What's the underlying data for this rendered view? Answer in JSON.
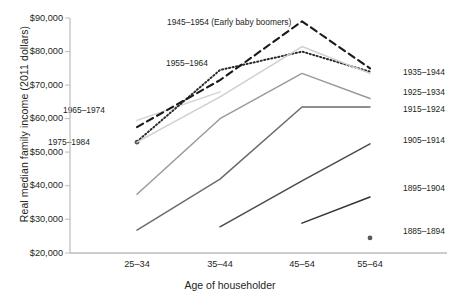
{
  "chart_data": {
    "type": "line",
    "title": "",
    "xlabel": "Age of householder",
    "ylabel": "Real median family income (2011 dollars)",
    "categories": [
      "25–34",
      "35–44",
      "45–54",
      "55–64"
    ],
    "ylim": [
      20000,
      90000
    ],
    "ytick_labels": [
      "$20,000",
      "$30,000",
      "$40,000",
      "$50,000",
      "$60,000",
      "$70,000",
      "$80,000",
      "$90,000"
    ],
    "ytick_values": [
      20000,
      30000,
      40000,
      50000,
      60000,
      70000,
      80000,
      90000
    ],
    "grid": false,
    "legend": "inline-labels",
    "series": [
      {
        "name": "1975–1984",
        "label": "1975–1984",
        "style": "marker",
        "color": "#5a5a5a",
        "x": [
          "25–34"
        ],
        "values": [
          53000
        ]
      },
      {
        "name": "1965–1974",
        "label": "1965–1974",
        "style": "solid",
        "color": "#d2d2d2",
        "x": [
          "25–34",
          "35–44"
        ],
        "values": [
          59500,
          68000
        ]
      },
      {
        "name": "1955–1964",
        "label": "1955–1964",
        "style": "dotted",
        "color": "#2b2b2b",
        "x": [
          "25–34",
          "35–44",
          "45–54",
          "55–64"
        ],
        "values": [
          53200,
          74500,
          80000,
          74000
        ]
      },
      {
        "name": "1945–1954 (Early baby boomers)",
        "label": "1945–1954 (Early baby boomers)",
        "style": "dashed",
        "color": "#1a1a1a",
        "x": [
          "25–34",
          "35–44",
          "45–54",
          "55–64"
        ],
        "values": [
          57500,
          71500,
          89000,
          75000
        ]
      },
      {
        "name": "1935–1944",
        "label": "1935–1944",
        "style": "solid",
        "color": "#cfcfcf",
        "x": [
          "25–34",
          "35–44",
          "45–54",
          "55–64"
        ],
        "values": [
          53000,
          66500,
          81500,
          73500
        ]
      },
      {
        "name": "1925–1934",
        "label": "1925–1934",
        "style": "solid",
        "color": "#9a9a9a",
        "x": [
          "25–34",
          "35–44",
          "45–54",
          "55–64"
        ],
        "values": [
          37500,
          60000,
          73500,
          66000
        ]
      },
      {
        "name": "1915–1924",
        "label": "1915–1924",
        "style": "solid",
        "color": "#6b6b6b",
        "x": [
          "25–34",
          "35–44",
          "45–54",
          "55–64"
        ],
        "values": [
          26800,
          42000,
          63500,
          63500
        ]
      },
      {
        "name": "1905–1914",
        "label": "1905–1914",
        "style": "solid",
        "color": "#4a4a4a",
        "x": [
          "35–44",
          "45–54",
          "55–64"
        ],
        "values": [
          27800,
          41500,
          52500
        ]
      },
      {
        "name": "1895–1904",
        "label": "1895–1904",
        "style": "solid",
        "color": "#333333",
        "x": [
          "45–54",
          "55–64"
        ],
        "values": [
          28900,
          36700
        ]
      },
      {
        "name": "1885–1894",
        "label": "1885–1894",
        "style": "marker",
        "color": "#5a5a5a",
        "x": [
          "55–64"
        ],
        "values": [
          24500
        ]
      }
    ],
    "annotations": [
      {
        "text": "1945–1954 (Early baby boomers)",
        "x": 167,
        "y": 22
      },
      {
        "text": "1955–1964",
        "x": 166,
        "y": 63
      },
      {
        "text": "1965–1974",
        "x": 63,
        "y": 110
      },
      {
        "text": "1975–1984",
        "x": 63,
        "y": 142
      },
      {
        "text": "1935–1944",
        "x": 403,
        "y": 72
      },
      {
        "text": "1925–1934",
        "x": 403,
        "y": 92
      },
      {
        "text": "1915–1924",
        "x": 403,
        "y": 109
      },
      {
        "text": "1905–1914",
        "x": 403,
        "y": 140
      },
      {
        "text": "1895–1904",
        "x": 403,
        "y": 188
      },
      {
        "text": "1885–1894",
        "x": 403,
        "y": 231
      }
    ]
  }
}
